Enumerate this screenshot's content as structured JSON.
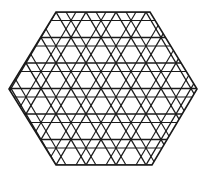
{
  "figure": {
    "stroke_color": "#1a1a1a",
    "background": "#ffffff",
    "hexagon": {
      "vertices": [
        [
          56,
          12
        ],
        [
          150,
          12
        ],
        [
          197,
          89
        ],
        [
          152,
          165
        ],
        [
          56,
          165
        ],
        [
          9,
          89
        ]
      ]
    },
    "lattice": {
      "row_height": 25.5,
      "column_spacing": 30,
      "origin": [
        56,
        12
      ],
      "secondary_offset": 8.5
    }
  }
}
